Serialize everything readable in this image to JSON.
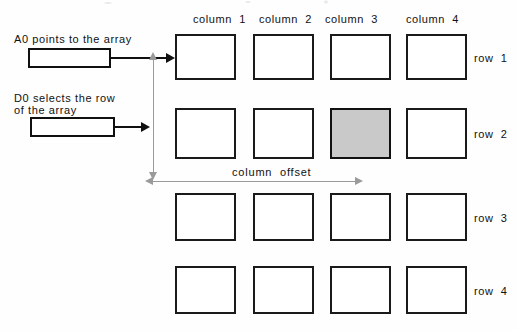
{
  "figure": {
    "background_color": "#fefefe",
    "ink_color": "#111111",
    "measure_color": "#9a9a9a",
    "selected_cell_color": "#c9c9c9"
  },
  "pointers": {
    "a0": {
      "label": "A0 points to the array",
      "register_value": "",
      "target": "row 1 column 1"
    },
    "d0": {
      "label_line1": "D0 selects the row",
      "label_line2": "of the array",
      "register_value": "",
      "target": "row 2"
    }
  },
  "measurements": {
    "column_offset_label": "column  offset",
    "row_offset_label": ""
  },
  "grid": {
    "column_headers": [
      "column  1",
      "column  2",
      "column  3",
      "column  4"
    ],
    "row_labels": [
      "row  1",
      "row  2",
      "row  3",
      "row  4"
    ],
    "rows": [
      [
        {
          "id": "r1c1",
          "selected": false
        },
        {
          "id": "r1c2",
          "selected": false
        },
        {
          "id": "r1c3",
          "selected": false
        },
        {
          "id": "r1c4",
          "selected": false
        }
      ],
      [
        {
          "id": "r2c1",
          "selected": false
        },
        {
          "id": "r2c2",
          "selected": false
        },
        {
          "id": "r2c3",
          "selected": true
        },
        {
          "id": "r2c4",
          "selected": false
        }
      ],
      [
        {
          "id": "r3c1",
          "selected": false
        },
        {
          "id": "r3c2",
          "selected": false
        },
        {
          "id": "r3c3",
          "selected": false
        },
        {
          "id": "r3c4",
          "selected": false
        }
      ],
      [
        {
          "id": "r4c1",
          "selected": false
        },
        {
          "id": "r4c2",
          "selected": false
        },
        {
          "id": "r4c3",
          "selected": false
        },
        {
          "id": "r4c4",
          "selected": false
        }
      ]
    ]
  }
}
